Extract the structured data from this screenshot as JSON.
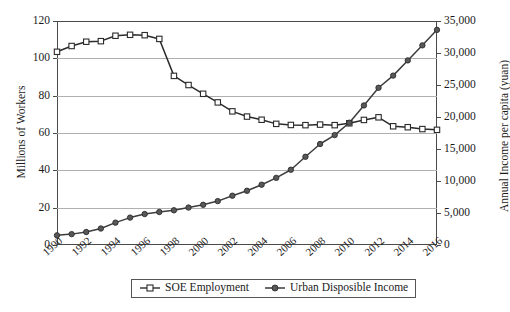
{
  "chart_data": {
    "type": "line",
    "title": "",
    "xlabel": "",
    "ylabel": "Millions of Workers",
    "y2label": "Annual Income per capita (yuan)",
    "xlim": [
      1990,
      2016
    ],
    "ylim": [
      0,
      120
    ],
    "y2lim": [
      0,
      35000
    ],
    "grid": true,
    "legend_position": "bottom-center",
    "x": [
      1990,
      1991,
      1992,
      1993,
      1994,
      1995,
      1996,
      1997,
      1998,
      1999,
      2000,
      2001,
      2002,
      2003,
      2004,
      2005,
      2006,
      2007,
      2008,
      2009,
      2010,
      2011,
      2012,
      2013,
      2014,
      2015,
      2016
    ],
    "yticks_left": [
      "0",
      "20",
      "40",
      "60",
      "80",
      "100",
      "120"
    ],
    "yticks_right": [
      "0",
      "5,000",
      "10,000",
      "15,000",
      "20,000",
      "25,000",
      "30,000",
      "35,000"
    ],
    "xticks": [
      "1990",
      "1992",
      "1994",
      "1996",
      "1998",
      "2000",
      "2002",
      "2004",
      "2006",
      "2008",
      "2010",
      "2012",
      "2014",
      "2016"
    ],
    "series": [
      {
        "name": "SOE Employment",
        "axis": "left",
        "marker": "open-square",
        "color": "#2b2b2b",
        "values": [
          103.5,
          106.6,
          108.9,
          109.2,
          112.1,
          112.6,
          112.4,
          110.4,
          90.6,
          85.7,
          81.0,
          76.4,
          71.6,
          68.8,
          67.1,
          64.9,
          64.3,
          64.2,
          64.5,
          64.2,
          65.2,
          67.0,
          68.4,
          63.6,
          63.1,
          62.1,
          61.7
        ]
      },
      {
        "name": "Urban Disposible Income",
        "axis": "right",
        "marker": "filled-circle",
        "color": "#3d3d3d",
        "values": [
          1510,
          1700,
          2027,
          2577,
          3496,
          4283,
          4839,
          5160,
          5425,
          5854,
          6280,
          6860,
          7703,
          8472,
          9422,
          10493,
          11760,
          13786,
          15781,
          17175,
          19109,
          21810,
          24565,
          26467,
          28844,
          31195,
          33616
        ]
      }
    ]
  },
  "legend": {
    "items": [
      {
        "label": "SOE Employment",
        "marker": "open-square"
      },
      {
        "label": "Urban Disposible Income",
        "marker": "filled-circle"
      }
    ]
  }
}
